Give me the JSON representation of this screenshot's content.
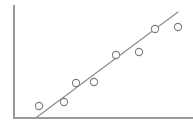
{
  "figure": {
    "width": 193,
    "height": 127,
    "background_color": "#ffffff",
    "has_title": false,
    "has_legend": false,
    "has_tick_labels": false,
    "has_gridlines": false,
    "title": "",
    "subtitle": ""
  },
  "axes": {
    "color": "#999999",
    "stroke_width": 2,
    "style": "L-shaped spine, no ticks, no labels",
    "y_axis": {
      "x": 13,
      "y_top": 5,
      "y_bottom": 118
    },
    "x_axis": {
      "y": 118,
      "x_left": 13,
      "x_right": 193
    },
    "xlabel": "",
    "ylabel": ""
  },
  "chart_data": {
    "type": "scatter",
    "title": "",
    "subtitle": "",
    "xlabel": "",
    "ylabel": "",
    "xlim": [
      0,
      100
    ],
    "ylim": [
      0,
      100
    ],
    "grid": false,
    "legend": false,
    "legend_position": "none",
    "marker": {
      "shape": "open-circle",
      "radius_px": 3.6,
      "fill_color": "#ffffff",
      "stroke_color": "#7d7d7d",
      "stroke_width": 1.1
    },
    "series": [
      {
        "name": "observations",
        "type": "scatter",
        "x": [
          14.4,
          28.3,
          35.0,
          45.0,
          57.2,
          70.0,
          78.9,
          91.7
        ],
        "y": [
          10.6,
          14.2,
          31.0,
          31.9,
          55.8,
          58.4,
          78.8,
          80.5
        ],
        "points_px": [
          {
            "cx": 39,
            "cy": 106
          },
          {
            "cx": 64,
            "cy": 102
          },
          {
            "cx": 76,
            "cy": 83
          },
          {
            "cx": 94,
            "cy": 82
          },
          {
            "cx": 116,
            "cy": 55
          },
          {
            "cx": 139,
            "cy": 52
          },
          {
            "cx": 155,
            "cy": 29
          },
          {
            "cx": 178,
            "cy": 27
          }
        ]
      }
    ],
    "trend_line": {
      "name": "fitted line",
      "type": "line",
      "color": "#8a8a8a",
      "stroke_width": 1.1,
      "start_px": {
        "x": 37,
        "y": 117
      },
      "end_px": {
        "x": 178,
        "y": 12
      },
      "slope_px": -0.745,
      "x_range": [
        13.3,
        91.7
      ],
      "y_range": [
        1.0,
        93.8
      ]
    }
  }
}
